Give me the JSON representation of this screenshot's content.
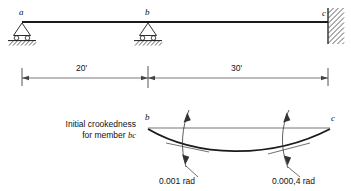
{
  "figure": {
    "stroke_color": "#1a1a1a",
    "thin_color": "#555555"
  },
  "beam_diagram": {
    "nodes": [
      {
        "id": "a",
        "label": "a",
        "support": "roller",
        "x": 22,
        "y": 22
      },
      {
        "id": "b",
        "label": "b",
        "support": "roller",
        "x": 148,
        "y": 22
      },
      {
        "id": "c",
        "label": "c",
        "support": "fixed",
        "x": 328,
        "y": 22
      }
    ]
  },
  "dimensions": {
    "spans": [
      {
        "label": "20'",
        "from": "a",
        "to": "b"
      },
      {
        "label": "30'",
        "from": "b",
        "to": "c"
      }
    ]
  },
  "crookedness_diagram": {
    "caption_line1": "Initial crookedness",
    "caption_line2_prefix": "for member ",
    "caption_line2_member": "bc",
    "end_labels": [
      {
        "id": "b",
        "label": "b"
      },
      {
        "id": "c",
        "label": "c"
      }
    ],
    "angles": [
      {
        "label": "0.001 rad",
        "at": "b-end"
      },
      {
        "label": "0.000,4 rad",
        "at": "c-end"
      }
    ]
  }
}
